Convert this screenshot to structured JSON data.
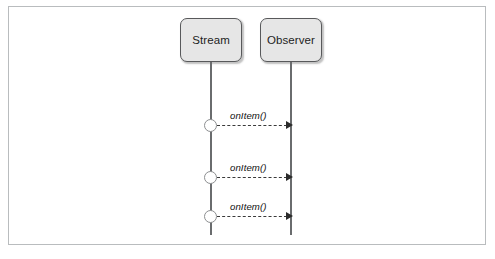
{
  "diagram": {
    "type": "uml-sequence-diagram",
    "frame": {
      "border_color": "#b9bcbe",
      "background_color": "#ffffff"
    },
    "participants": [
      {
        "id": "stream",
        "label": "Stream",
        "fill_color": "#e6e6e6",
        "border_color": "#58595b"
      },
      {
        "id": "observer",
        "label": "Observer",
        "fill_color": "#e6e6e6",
        "border_color": "#58595b"
      }
    ],
    "messages": [
      {
        "id": "message-1",
        "label": "onItem()",
        "from": "stream",
        "to": "observer",
        "line_style": "dashed",
        "arrow_style": "filled",
        "origin_marker": "circle"
      },
      {
        "id": "message-2",
        "label": "onItem()",
        "from": "stream",
        "to": "observer",
        "line_style": "dashed",
        "arrow_style": "filled",
        "origin_marker": "circle"
      },
      {
        "id": "message-3",
        "label": "onItem()",
        "from": "stream",
        "to": "observer",
        "line_style": "dashed",
        "arrow_style": "filled",
        "origin_marker": "circle"
      }
    ]
  }
}
